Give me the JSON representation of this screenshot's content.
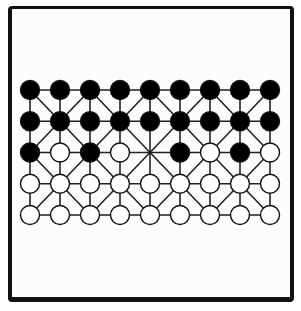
{
  "game": {
    "name": "Fanorona",
    "board": {
      "cols": 9,
      "rows": 5,
      "origin_x": 30,
      "origin_y": 90,
      "spacing_x": 30,
      "spacing_y": 31.25,
      "piece_radius": 9.5,
      "line_color": "#222222",
      "black_color": "#000000",
      "white_color": "#ffffff"
    },
    "position": [
      [
        "B",
        "B",
        "B",
        "B",
        "B",
        "B",
        "B",
        "B",
        "B"
      ],
      [
        "B",
        "B",
        "B",
        "B",
        "B",
        "B",
        "B",
        "B",
        "B"
      ],
      [
        "B",
        "W",
        "B",
        "W",
        "",
        "B",
        "W",
        "B",
        "W"
      ],
      [
        "W",
        "W",
        "W",
        "W",
        "W",
        "W",
        "W",
        "W",
        "W"
      ],
      [
        "W",
        "W",
        "W",
        "W",
        "W",
        "W",
        "W",
        "W",
        "W"
      ]
    ],
    "piece_counts": {
      "black": 22,
      "white": 22,
      "empty": 1
    }
  }
}
